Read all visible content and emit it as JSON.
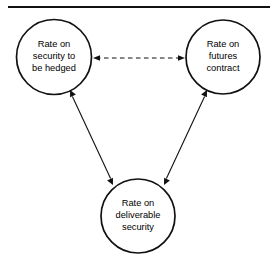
{
  "figure": {
    "background_color": "#ffffff",
    "line_color": "#111111",
    "top_rule": {
      "name": "horizontal-rule",
      "x1": 8,
      "y1": 7,
      "x2": 270,
      "y2": 7
    },
    "nodes": [
      {
        "id": "security-to-be-hedged",
        "cx": 54,
        "cy": 57,
        "r": 37.5,
        "lines": [
          "Rate on",
          "security to",
          "be hedged"
        ]
      },
      {
        "id": "futures-contract",
        "cx": 223,
        "cy": 57,
        "r": 37,
        "lines": [
          "Rate on",
          "futures",
          "contract"
        ]
      },
      {
        "id": "deliverable-security",
        "cx": 138,
        "cy": 216,
        "r": 37,
        "lines": [
          "Rate on",
          "deliverable",
          "security"
        ]
      }
    ],
    "edges": [
      {
        "id": "hedged-to-futures",
        "style": "dashed",
        "arrows": "both",
        "from": "security-to-be-hedged",
        "to": "futures-contract",
        "x1": 93,
        "y1": 58,
        "x2": 185,
        "y2": 58
      },
      {
        "id": "deliverable-to-hedged",
        "style": "solid",
        "arrows": "both",
        "from": "deliverable-security",
        "to": "security-to-be-hedged",
        "x1": 113,
        "y1": 185,
        "x2": 70,
        "y2": 90
      },
      {
        "id": "deliverable-to-futures",
        "style": "solid",
        "arrows": "both",
        "from": "deliverable-security",
        "to": "futures-contract",
        "x1": 164,
        "y1": 185,
        "x2": 207,
        "y2": 90
      }
    ]
  }
}
